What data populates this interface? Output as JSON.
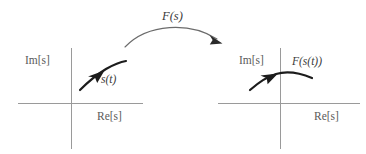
{
  "figure": {
    "background_color": "#ffffff",
    "axis_color": "#9a9a9a",
    "curve_color": "#1c1c1c",
    "label_color": "#4a4a4a"
  },
  "map_arrow": {
    "label": "F(s)",
    "direction": "left-to-right",
    "arrowhead": "arrowhead-right-down-icon"
  },
  "left_plane": {
    "name": "s-plane",
    "imaginary_axis_label": "Im[s]",
    "real_axis_label": "Re[s]",
    "curve_label": "s(t)",
    "curve_description": "trajectory arcing up and to the right in the second quadrant",
    "arrow_icon": "curve-direction-arrow-icon"
  },
  "right_plane": {
    "name": "F(s)-plane",
    "imaginary_axis_label": "Im[s]",
    "real_axis_label": "Re[s]",
    "curve_label": "F(s(t))",
    "curve_description": "trajectory rising from lower left, peaking near the imaginary axis, then falling to the right",
    "arrow_icon": "curve-direction-arrow-icon"
  }
}
